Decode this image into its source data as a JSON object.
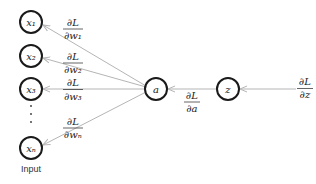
{
  "diagram": {
    "type": "backpropagation-neuron",
    "input_nodes": [
      {
        "label": "x₁",
        "grad_num": "∂L",
        "grad_den": "∂w₁"
      },
      {
        "label": "x₂",
        "grad_num": "∂L",
        "grad_den": "∂w₂"
      },
      {
        "label": "x₃",
        "grad_num": "∂L",
        "grad_den": "∂w₃"
      },
      {
        "label": "xₙ",
        "grad_num": "∂L",
        "grad_den": "∂wₙ"
      }
    ],
    "ellipsis": "⋮",
    "activation_node": {
      "label": "a",
      "grad_num": "∂L",
      "grad_den": "∂a"
    },
    "preactivation_node": {
      "label": "z"
    },
    "output_grad": {
      "grad_num": "∂L",
      "grad_den": "∂z"
    },
    "input_caption": "Input",
    "colors": {
      "node_stroke": "#1a1a1a",
      "edge": "#b5b5b5",
      "text": "#222222"
    }
  }
}
